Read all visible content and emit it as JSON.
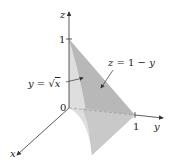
{
  "figure": {
    "type": "3d-region-diagram",
    "axes": {
      "x": {
        "label": "x"
      },
      "y": {
        "label": "y",
        "tick": "1"
      },
      "z": {
        "label": "z",
        "tick": "1"
      },
      "origin": "0"
    },
    "surfaces": [
      {
        "name": "parabolic-cylinder",
        "equation_lhs": "y =",
        "equation_rhs": "x",
        "display": "y = √x",
        "color": "#d9d9d9"
      },
      {
        "name": "plane",
        "equation": "z = 1 − y",
        "color": "#b5b5b5"
      }
    ],
    "colors": {
      "axis": "#333333",
      "light_face": "#dcdcdc",
      "dark_face": "#b3b3b3",
      "edge": "#9a9a9a"
    }
  }
}
